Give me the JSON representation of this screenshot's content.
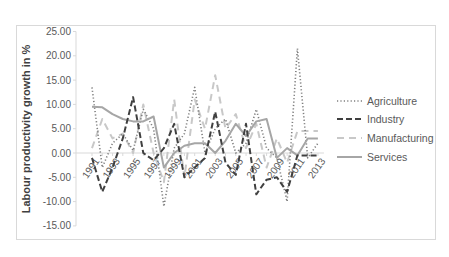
{
  "chart_data": {
    "type": "line",
    "title": "",
    "xlabel": "",
    "ylabel": "Labour productivity growth in %",
    "ylim": [
      -15,
      25
    ],
    "yticks": [
      "25.00",
      "20.00",
      "15.00",
      "10.00",
      "5.00",
      "0.00",
      "-5.00",
      "-10.00",
      "-15.00"
    ],
    "xtick_labels": [
      "1991",
      "1993",
      "1995",
      "1997",
      "1999",
      "2001",
      "2003",
      "2005",
      "2007",
      "2009",
      "2011",
      "2013"
    ],
    "x": [
      1991,
      1992,
      1993,
      1994,
      1995,
      1996,
      1997,
      1998,
      1999,
      2000,
      2001,
      2002,
      2003,
      2004,
      2005,
      2006,
      2007,
      2008,
      2009,
      2010,
      2011,
      2012,
      2013
    ],
    "grid": false,
    "legend_position": "right",
    "series": [
      {
        "name": "Agriculture",
        "style": "dotted",
        "color": "#7f7f7f",
        "values": [
          13.5,
          -3,
          2,
          4,
          0.5,
          9,
          5,
          -11,
          1,
          4,
          13.5,
          0,
          5,
          7,
          0,
          2,
          9,
          1,
          -1,
          -10,
          21.5,
          -1,
          2
        ]
      },
      {
        "name": "Industry",
        "style": "dashed",
        "color": "#404040",
        "values": [
          -1,
          -8,
          -3,
          3,
          11.5,
          0,
          -1.5,
          1,
          6,
          -5,
          -3,
          -1,
          8.5,
          -2,
          -4.5,
          6,
          -8.5,
          -5.5,
          -5,
          -8,
          -0.5,
          -0.5,
          -0.5
        ]
      },
      {
        "name": "Manufacturing",
        "style": "long-dash",
        "color": "#c8c8c8",
        "values": [
          1,
          7,
          3,
          4,
          0,
          10,
          0,
          -6,
          11,
          -5,
          11,
          5,
          16,
          5,
          8,
          1,
          6,
          -3,
          3,
          -2,
          4.5,
          4.5,
          4.5
        ]
      },
      {
        "name": "Services",
        "style": "solid",
        "color": "#a6a6a6",
        "values": [
          9.5,
          9.4,
          8,
          7,
          6.5,
          6.5,
          7.5,
          -3,
          0,
          1.5,
          2,
          2,
          0,
          2.5,
          6,
          3.5,
          6.5,
          7,
          -1,
          1,
          -0.5,
          3,
          3
        ]
      }
    ]
  }
}
